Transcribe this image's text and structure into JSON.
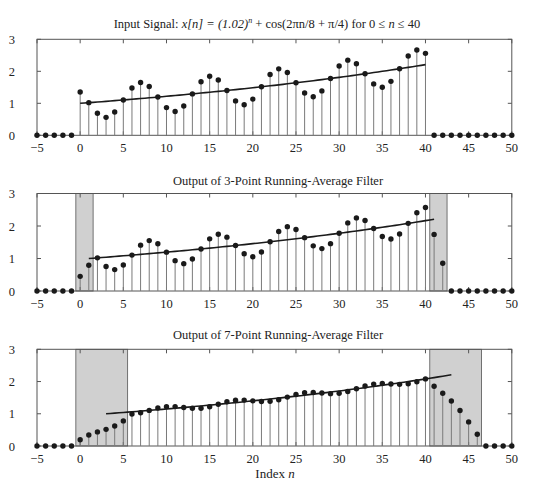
{
  "figure": {
    "x_label_prefix": "Index ",
    "x_label_var": "n"
  },
  "chart_data": [
    {
      "type": "stem",
      "title": "Input Signal:  x[n] = (1.02)^n + cos(2πn/8 + π/4) for 0 ≤ n ≤ 40",
      "title_parts": {
        "prefix": "Input Signal:  ",
        "lhs": "x[n] = (1.02)",
        "exp": "n",
        "rhs": " + cos(2πn/8 + π/4) for 0 ≤ ",
        "var": "n",
        "tail": " ≤ 40"
      },
      "xlabel": "",
      "ylabel": "",
      "xlim": [
        -5,
        50
      ],
      "ylim": [
        0,
        3
      ],
      "xticks": [
        -5,
        0,
        5,
        10,
        15,
        20,
        25,
        30,
        35,
        40,
        45,
        50
      ],
      "xtick_labels": [
        "−5",
        "0",
        "5",
        "10",
        "15",
        "20",
        "25",
        "30",
        "35",
        "40",
        "45",
        "50"
      ],
      "yticks": [
        0,
        1,
        2,
        3
      ],
      "ytick_labels": [
        "0",
        "1",
        "2",
        "3"
      ],
      "x": [
        -5,
        -4,
        -3,
        -2,
        -1,
        0,
        1,
        2,
        3,
        4,
        5,
        6,
        7,
        8,
        9,
        10,
        11,
        12,
        13,
        14,
        15,
        16,
        17,
        18,
        19,
        20,
        21,
        22,
        23,
        24,
        25,
        26,
        27,
        28,
        29,
        30,
        31,
        32,
        33,
        34,
        35,
        36,
        37,
        38,
        39,
        40,
        41,
        42,
        43,
        44,
        45,
        46,
        47,
        48,
        49,
        50
      ],
      "values": [
        0,
        0,
        0,
        0,
        0,
        1.354,
        1.02,
        0.687,
        0.561,
        0.729,
        1.104,
        1.48,
        1.649,
        1.525,
        1.195,
        0.865,
        0.743,
        0.915,
        1.294,
        1.673,
        1.846,
        1.726,
        1.4,
        1.075,
        0.957,
        1.132,
        1.516,
        1.9,
        2.077,
        1.962,
        1.641,
        1.32,
        1.207,
        1.387,
        1.776,
        2.165,
        2.348,
        2.238,
        1.922,
        1.607,
        1.5,
        1.686,
        2.081,
        2.476,
        2.665,
        2.561,
        0,
        0,
        0,
        0,
        0,
        0,
        0,
        0,
        0,
        0
      ],
      "trend": {
        "name": "(1.02)^n",
        "start": 0,
        "end": 40,
        "shift": 0,
        "base": 1.02
      },
      "shaded_regions": [],
      "grid": false
    },
    {
      "type": "stem",
      "title": "Output of 3-Point Running-Average Filter",
      "xlabel": "",
      "ylabel": "",
      "xlim": [
        -5,
        50
      ],
      "ylim": [
        0,
        3
      ],
      "xticks": [
        -5,
        0,
        5,
        10,
        15,
        20,
        25,
        30,
        35,
        40,
        45,
        50
      ],
      "xtick_labels": [
        "−5",
        "0",
        "5",
        "10",
        "15",
        "20",
        "25",
        "30",
        "35",
        "40",
        "45",
        "50"
      ],
      "yticks": [
        0,
        1,
        2,
        3
      ],
      "ytick_labels": [
        "0",
        "1",
        "2",
        "3"
      ],
      "x": [
        -5,
        -4,
        -3,
        -2,
        -1,
        0,
        1,
        2,
        3,
        4,
        5,
        6,
        7,
        8,
        9,
        10,
        11,
        12,
        13,
        14,
        15,
        16,
        17,
        18,
        19,
        20,
        21,
        22,
        23,
        24,
        25,
        26,
        27,
        28,
        29,
        30,
        31,
        32,
        33,
        34,
        35,
        36,
        37,
        38,
        39,
        40,
        41,
        42,
        43,
        44,
        45,
        46,
        47,
        48,
        49,
        50
      ],
      "values": [
        0,
        0,
        0,
        0,
        0,
        0.451,
        0.791,
        1.02,
        0.756,
        0.659,
        0.798,
        1.104,
        1.411,
        1.551,
        1.456,
        1.195,
        0.934,
        0.841,
        0.984,
        1.294,
        1.604,
        1.748,
        1.657,
        1.4,
        1.144,
        1.055,
        1.202,
        1.516,
        1.831,
        1.98,
        1.893,
        1.641,
        1.389,
        1.305,
        1.457,
        1.776,
        2.096,
        2.25,
        2.169,
        1.922,
        1.676,
        1.598,
        1.756,
        2.081,
        2.407,
        2.567,
        1.742,
        0.854,
        0,
        0,
        0,
        0,
        0,
        0,
        0,
        0
      ],
      "trend": {
        "name": "(1.02)^(n-1)",
        "start": 1,
        "end": 41,
        "shift": 1,
        "base": 1.02
      },
      "shaded_regions": [
        [
          -0.5,
          1.5
        ],
        [
          40.5,
          42.5
        ]
      ],
      "grid": false
    },
    {
      "type": "stem",
      "title": "Output of 7-Point Running-Average Filter",
      "xlabel": "Index n",
      "ylabel": "",
      "xlim": [
        -5,
        50
      ],
      "ylim": [
        0,
        3
      ],
      "xticks": [
        -5,
        0,
        5,
        10,
        15,
        20,
        25,
        30,
        35,
        40,
        45,
        50
      ],
      "xtick_labels": [
        "−5",
        "0",
        "5",
        "10",
        "15",
        "20",
        "25",
        "30",
        "35",
        "40",
        "45",
        "50"
      ],
      "yticks": [
        0,
        1,
        2,
        3
      ],
      "ytick_labels": [
        "0",
        "1",
        "2",
        "3"
      ],
      "x": [
        -5,
        -4,
        -3,
        -2,
        -1,
        0,
        1,
        2,
        3,
        4,
        5,
        6,
        7,
        8,
        9,
        10,
        11,
        12,
        13,
        14,
        15,
        16,
        17,
        18,
        19,
        20,
        21,
        22,
        23,
        24,
        25,
        26,
        27,
        28,
        29,
        30,
        31,
        32,
        33,
        34,
        35,
        36,
        37,
        38,
        39,
        40,
        41,
        42,
        43,
        44,
        45,
        46,
        47,
        48,
        49,
        50
      ],
      "values": [
        0,
        0,
        0,
        0,
        0,
        0.193,
        0.339,
        0.437,
        0.517,
        0.622,
        0.779,
        0.991,
        1.033,
        1.105,
        1.178,
        1.221,
        1.223,
        1.196,
        1.169,
        1.173,
        1.219,
        1.295,
        1.371,
        1.418,
        1.424,
        1.401,
        1.379,
        1.387,
        1.437,
        1.517,
        1.598,
        1.65,
        1.66,
        1.642,
        1.624,
        1.637,
        1.692,
        1.777,
        1.863,
        1.92,
        1.937,
        1.924,
        1.912,
        1.93,
        1.991,
        2.082,
        1.853,
        1.638,
        1.398,
        1.1,
        0.747,
        0.366,
        0,
        0,
        0,
        0
      ],
      "trend": {
        "name": "(1.02)^(n-3)",
        "start": 3,
        "end": 43,
        "shift": 3,
        "base": 1.02
      },
      "shaded_regions": [
        [
          -0.5,
          5.5
        ],
        [
          40.5,
          46.5
        ]
      ],
      "grid": false
    }
  ],
  "colors": {
    "dot": "#1a1a1a",
    "stem": "#7a7a7a",
    "trend": "#1a1a1a",
    "shade": "#d0d0d0",
    "frame": "#555555",
    "text": "#222222"
  }
}
